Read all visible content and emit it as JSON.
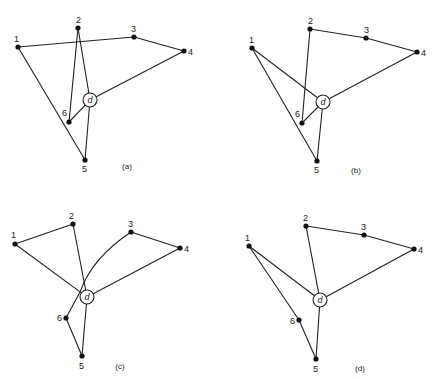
{
  "figure": {
    "panels": [
      {
        "id": "a",
        "caption": "(a)",
        "caption_pos": [
          127,
          169
        ],
        "depot": {
          "label": "d",
          "x": 90,
          "y": 100,
          "r": 7
        },
        "nodes": [
          {
            "label": "1",
            "x": 18,
            "y": 47,
            "lx": 14,
            "ly": 42
          },
          {
            "label": "2",
            "x": 78,
            "y": 28,
            "lx": 76,
            "ly": 23
          },
          {
            "label": "3",
            "x": 134,
            "y": 37,
            "lx": 131,
            "ly": 32
          },
          {
            "label": "4",
            "x": 184,
            "y": 51,
            "lx": 188,
            "ly": 55
          },
          {
            "label": "5",
            "x": 85,
            "y": 160,
            "lx": 82,
            "ly": 172
          },
          {
            "label": "6",
            "x": 69,
            "y": 122,
            "lx": 62,
            "ly": 116
          }
        ],
        "edges": [
          [
            "1",
            "3"
          ],
          [
            "3",
            "4"
          ],
          [
            "4",
            "d"
          ],
          [
            "1",
            "5"
          ],
          [
            "2",
            "6"
          ],
          [
            "2",
            "d"
          ],
          [
            "6",
            "d"
          ],
          [
            "d",
            "5"
          ]
        ]
      },
      {
        "id": "b",
        "caption": "(b)",
        "caption_pos": [
          356,
          173
        ],
        "depot": {
          "label": "d",
          "x": 323,
          "y": 102,
          "r": 7
        },
        "nodes": [
          {
            "label": "1",
            "x": 252,
            "y": 48,
            "lx": 249,
            "ly": 43
          },
          {
            "label": "2",
            "x": 310,
            "y": 29,
            "lx": 308,
            "ly": 24
          },
          {
            "label": "3",
            "x": 366,
            "y": 38,
            "lx": 364,
            "ly": 33
          },
          {
            "label": "4",
            "x": 417,
            "y": 52,
            "lx": 421,
            "ly": 56
          },
          {
            "label": "5",
            "x": 317,
            "y": 161,
            "lx": 314,
            "ly": 173
          },
          {
            "label": "6",
            "x": 302,
            "y": 123,
            "lx": 295,
            "ly": 117
          }
        ],
        "edges": [
          [
            "2",
            "3"
          ],
          [
            "3",
            "4"
          ],
          [
            "4",
            "d"
          ],
          [
            "1",
            "d"
          ],
          [
            "1",
            "5"
          ],
          [
            "2",
            "6"
          ],
          [
            "6",
            "d"
          ],
          [
            "d",
            "5"
          ]
        ]
      },
      {
        "id": "c",
        "caption": "(c)",
        "caption_pos": [
          120,
          369
        ],
        "depot": {
          "label": "d",
          "x": 87,
          "y": 297,
          "r": 7
        },
        "nodes": [
          {
            "label": "1",
            "x": 15,
            "y": 244,
            "lx": 11,
            "ly": 238
          },
          {
            "label": "2",
            "x": 73,
            "y": 224,
            "lx": 69,
            "ly": 219
          },
          {
            "label": "3",
            "x": 131,
            "y": 232,
            "lx": 128,
            "ly": 227
          },
          {
            "label": "4",
            "x": 180,
            "y": 248,
            "lx": 184,
            "ly": 252
          },
          {
            "label": "5",
            "x": 82,
            "y": 356,
            "lx": 79,
            "ly": 369
          },
          {
            "label": "6",
            "x": 66,
            "y": 318,
            "lx": 57,
            "ly": 321
          }
        ],
        "edges": [
          [
            "1",
            "2"
          ],
          [
            "1",
            "d"
          ],
          [
            "2",
            "d"
          ],
          [
            "3",
            "4"
          ],
          [
            "4",
            "d"
          ],
          [
            "6",
            "5"
          ],
          [
            "5",
            "d"
          ]
        ],
        "curves": [
          {
            "from": "3",
            "to": "6",
            "path": "M131,232 Q92,258 80,292 L66,318"
          }
        ]
      },
      {
        "id": "d",
        "caption": "(d)",
        "caption_pos": [
          360,
          371
        ],
        "depot": {
          "label": "d",
          "x": 320,
          "y": 300,
          "r": 7
        },
        "nodes": [
          {
            "label": "1",
            "x": 249,
            "y": 246,
            "lx": 245,
            "ly": 241
          },
          {
            "label": "2",
            "x": 306,
            "y": 226,
            "lx": 303,
            "ly": 221
          },
          {
            "label": "3",
            "x": 364,
            "y": 235,
            "lx": 361,
            "ly": 230
          },
          {
            "label": "4",
            "x": 414,
            "y": 249,
            "lx": 418,
            "ly": 253
          },
          {
            "label": "5",
            "x": 316,
            "y": 359,
            "lx": 313,
            "ly": 372
          },
          {
            "label": "6",
            "x": 299,
            "y": 320,
            "lx": 290,
            "ly": 324
          }
        ],
        "edges": [
          [
            "2",
            "3"
          ],
          [
            "3",
            "4"
          ],
          [
            "4",
            "d"
          ],
          [
            "1",
            "d"
          ],
          [
            "1",
            "6"
          ],
          [
            "6",
            "5"
          ],
          [
            "2",
            "d"
          ],
          [
            "d",
            "5"
          ]
        ]
      }
    ]
  }
}
